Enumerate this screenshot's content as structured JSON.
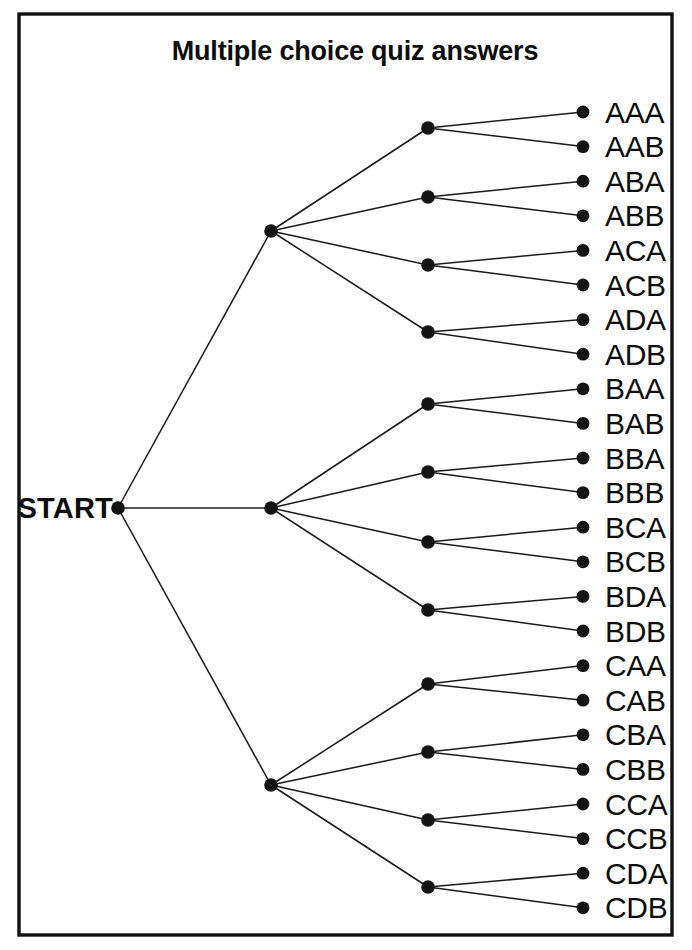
{
  "figure": {
    "title": "Multiple choice quiz answers",
    "root_label": "START",
    "background_color": "#ffffff",
    "ink_color": "#141414",
    "border_color": "#111111"
  },
  "chart_data": {
    "type": "diagram",
    "diagram_type": "probability-tree",
    "title": "Multiple choice quiz answers",
    "root": "START",
    "depth": 3,
    "branching": [
      3,
      4,
      2
    ],
    "level1_labels": [
      "A",
      "B",
      "C"
    ],
    "level2_labels": [
      "A",
      "B",
      "C",
      "D"
    ],
    "level3_labels": [
      "A",
      "B"
    ],
    "leaf_count": 24,
    "outcomes": [
      "AAA",
      "AAB",
      "ABA",
      "ABB",
      "ACA",
      "ACB",
      "ADA",
      "ADB",
      "BAA",
      "BAB",
      "BBA",
      "BBB",
      "BCA",
      "BCB",
      "BDA",
      "BDB",
      "CAA",
      "CAB",
      "CBA",
      "CBB",
      "CCA",
      "CCB",
      "CDA",
      "CDB"
    ],
    "groups": [
      {
        "name": "A",
        "subgroups": [
          {
            "name": "AA",
            "leaves": [
              "AAA",
              "AAB"
            ]
          },
          {
            "name": "AB",
            "leaves": [
              "ABA",
              "ABB"
            ]
          },
          {
            "name": "AC",
            "leaves": [
              "ACA",
              "ACB"
            ]
          },
          {
            "name": "AD",
            "leaves": [
              "ADA",
              "ADB"
            ]
          }
        ]
      },
      {
        "name": "B",
        "subgroups": [
          {
            "name": "BA",
            "leaves": [
              "BAA",
              "BAB"
            ]
          },
          {
            "name": "BB",
            "leaves": [
              "BBA",
              "BBB"
            ]
          },
          {
            "name": "BC",
            "leaves": [
              "BCA",
              "BCB"
            ]
          },
          {
            "name": "BD",
            "leaves": [
              "BDA",
              "BDB"
            ]
          }
        ]
      },
      {
        "name": "C",
        "subgroups": [
          {
            "name": "CA",
            "leaves": [
              "CAA",
              "CAB"
            ]
          },
          {
            "name": "CB",
            "leaves": [
              "CBA",
              "CBB"
            ]
          },
          {
            "name": "CC",
            "leaves": [
              "CCA",
              "CCB"
            ]
          },
          {
            "name": "CD",
            "leaves": [
              "CDA",
              "CDB"
            ]
          }
        ]
      }
    ]
  },
  "geometry": {
    "frame": {
      "x": 19,
      "y": 14,
      "width": 653,
      "height": 921
    },
    "title_pos": {
      "x": 355,
      "y": 60
    },
    "root": {
      "x": 118,
      "y": 508
    },
    "root_label_pos": {
      "x": 113,
      "y": 518
    },
    "level1_x": 271,
    "level1_y": [
      231,
      508,
      785
    ],
    "level2_x": 428,
    "level2_y": [
      128,
      197,
      265,
      332,
      404,
      472,
      542,
      610,
      684,
      752,
      820,
      887
    ],
    "leaf_x": 583,
    "leaf_y_start": 112,
    "leaf_y_step": 34.6,
    "label_x": 605,
    "node_radius": 6.8,
    "leaf_radius": 6.4
  }
}
